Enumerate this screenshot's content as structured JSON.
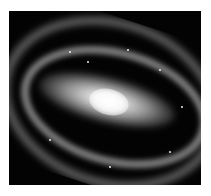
{
  "image": {
    "subject": "barred spiral galaxy",
    "background_color": "#ffffff",
    "frame_color": "#030303",
    "core_color": "#ffffff"
  }
}
